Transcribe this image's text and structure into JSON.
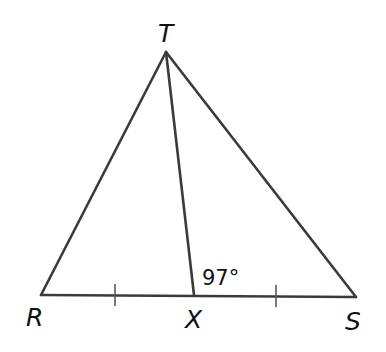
{
  "diagram": {
    "type": "triangle",
    "vertices": {
      "T": {
        "label": "T",
        "x": 166,
        "y": 52
      },
      "R": {
        "label": "R",
        "x": 41,
        "y": 295
      },
      "S": {
        "label": "S",
        "x": 356,
        "y": 297
      },
      "X": {
        "label": "X",
        "x": 194,
        "y": 295
      }
    },
    "segments": [
      "TR",
      "TS",
      "RS",
      "TX"
    ],
    "congruence_marks": [
      {
        "segment": "RX",
        "ticks": 1
      },
      {
        "segment": "XS",
        "ticks": 1
      }
    ],
    "angle_label": {
      "text": "97°",
      "at": "TXS"
    },
    "colors": {
      "line": "#3a3a3a",
      "text": "#111111",
      "background": "#ffffff"
    }
  }
}
